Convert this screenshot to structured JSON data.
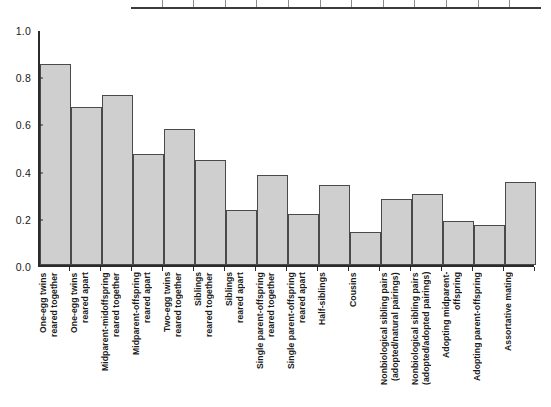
{
  "chart_data": {
    "type": "bar",
    "title": "",
    "subtitle": "",
    "xlabel": "",
    "ylabel": "",
    "ylim": [
      0.0,
      1.0
    ],
    "grid": false,
    "legend": null,
    "bar_color": "#cfcfcf",
    "bar_edge_color": "#4a4a4a",
    "axis_color": "#2b2b2b",
    "ytick_labels": [
      "1.0",
      "0.8",
      "0.6",
      "0.4",
      "0.2",
      "0.0"
    ],
    "ytick_values": [
      1.0,
      0.8,
      0.6,
      0.4,
      0.2,
      0.0
    ],
    "categories": [
      "One-egg twins\nreared together",
      "One-egg twins\nreared apart",
      "Midparent-midoffspring\nreared together",
      "Midparent-offspring\nreared apart",
      "Two-egg twins\nreared together",
      "Siblings\nreared together",
      "Siblings\nreared apart",
      "Single parent-offspring\nreared together",
      "Single parent-offspring\nreared apart",
      "Half-siblings",
      "Cousins",
      "Nonbiological sibling pairs\n(adopted/natural pairings)",
      "Nonbiological sibling pairs\n(adopted/adopted pairings)",
      "Adopting midparent-\noffspring",
      "Adopting parent-offspring",
      "Assortative mating"
    ],
    "values": [
      0.85,
      0.67,
      0.72,
      0.47,
      0.575,
      0.445,
      0.235,
      0.38,
      0.215,
      0.34,
      0.14,
      0.28,
      0.3,
      0.185,
      0.17,
      0.35
    ]
  },
  "table_remnant": {
    "column_count": 13
  }
}
